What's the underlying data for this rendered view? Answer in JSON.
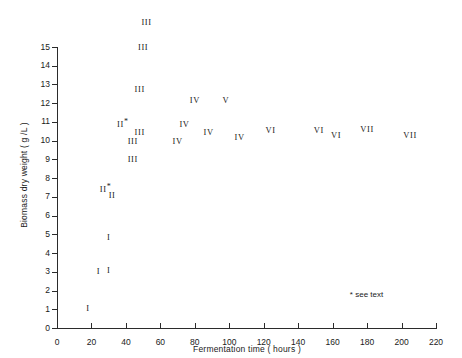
{
  "chart_data": {
    "type": "scatter",
    "title": "",
    "xlabel": "Fermentation time ( hours )",
    "ylabel": "Biomass dry weight ( g /L )",
    "xlim": [
      0,
      224
    ],
    "ylim": [
      0,
      16.5
    ],
    "xticks": [
      0,
      20,
      40,
      60,
      80,
      100,
      120,
      140,
      160,
      180,
      200,
      220
    ],
    "xticklabels": [
      "0",
      "20",
      "40",
      "60",
      "80",
      "100",
      "120",
      "140",
      "160",
      "180",
      "200",
      "220"
    ],
    "yticks": [
      0,
      1,
      2,
      3,
      4,
      5,
      6,
      7,
      8,
      9,
      10,
      11,
      12,
      13,
      14,
      15
    ],
    "yticklabels": [
      "0",
      "1",
      "2",
      "3",
      "4",
      "5",
      "6",
      "7",
      "8",
      "9",
      "10",
      "11",
      "12",
      "13",
      "14",
      "15"
    ],
    "grid": false,
    "legend": false,
    "marker_style": "roman-numeral-text",
    "annotations": [
      {
        "name": "see-text-note",
        "text": "* see text",
        "x": 170,
        "y": 1.8
      }
    ],
    "points": [
      {
        "label": "I",
        "x": 18,
        "y": 1.05,
        "star": false
      },
      {
        "label": "I",
        "x": 24,
        "y": 3.05,
        "star": false
      },
      {
        "label": "I",
        "x": 30,
        "y": 3.1,
        "star": false
      },
      {
        "label": "I",
        "x": 30,
        "y": 4.85,
        "star": false
      },
      {
        "label": "II",
        "x": 28,
        "y": 7.45,
        "star": true
      },
      {
        "label": "II",
        "x": 32,
        "y": 7.1,
        "star": false
      },
      {
        "label": "II",
        "x": 38,
        "y": 10.95,
        "star": true
      },
      {
        "label": "III",
        "x": 44,
        "y": 9.0,
        "star": false
      },
      {
        "label": "III",
        "x": 44,
        "y": 10.0,
        "star": false
      },
      {
        "label": "III",
        "x": 48,
        "y": 10.45,
        "star": false
      },
      {
        "label": "III",
        "x": 48,
        "y": 12.75,
        "star": false
      },
      {
        "label": "III",
        "x": 50,
        "y": 15.0,
        "star": false
      },
      {
        "label": "III",
        "x": 52,
        "y": 16.35,
        "star": false
      },
      {
        "label": "IV",
        "x": 70,
        "y": 10.0,
        "star": false
      },
      {
        "label": "IV",
        "x": 74,
        "y": 10.9,
        "star": false
      },
      {
        "label": "IV",
        "x": 80,
        "y": 12.15,
        "star": false
      },
      {
        "label": "IV",
        "x": 88,
        "y": 10.45,
        "star": false
      },
      {
        "label": "V",
        "x": 98,
        "y": 12.15,
        "star": false
      },
      {
        "label": "IV",
        "x": 106,
        "y": 10.2,
        "star": false
      },
      {
        "label": "VI",
        "x": 124,
        "y": 10.55,
        "star": false
      },
      {
        "label": "VI",
        "x": 152,
        "y": 10.55,
        "star": false
      },
      {
        "label": "VI",
        "x": 162,
        "y": 10.3,
        "star": false
      },
      {
        "label": "VII",
        "x": 180,
        "y": 10.6,
        "star": false
      },
      {
        "label": "VII",
        "x": 205,
        "y": 10.3,
        "star": false
      }
    ]
  }
}
